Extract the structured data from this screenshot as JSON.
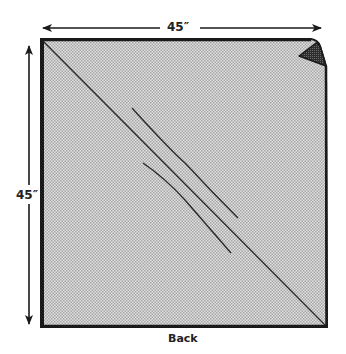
{
  "diagram": {
    "title": "Back",
    "dimensions": {
      "width_label": "45″",
      "height_label": "45″"
    },
    "fabric": {
      "shape": "square",
      "fill": "halftone-gray",
      "corner_detail": "top-right corner folded/curled",
      "diagonal": "line from top-left to bottom-right corner",
      "stitch_lines": 2
    },
    "colors": {
      "outline": "#1a1a1a",
      "fill_light": "#e2e2e2",
      "fill_dark": "#a8a8a8",
      "fold_shadow": "#3a3a3a"
    }
  }
}
